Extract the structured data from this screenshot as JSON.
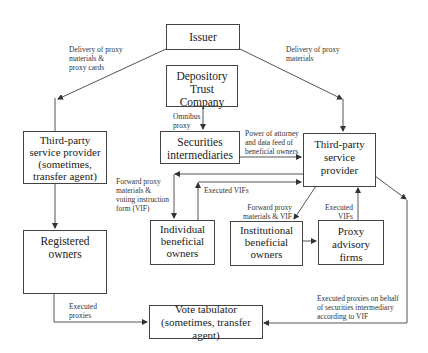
{
  "diagram": {
    "nodes": {
      "issuer": "Issuer",
      "dtc": "Depository\nTrust Company",
      "securities_intermediaries": "Securities\nintermediaries",
      "third_party_right": "Third-party\nservice provider",
      "third_party_left": "Third-party\nservice provider\n(sometimes,\ntransfer agent)",
      "registered_owners": "Registered\nowners",
      "individual_bo": "Individual\nbeneficial\nowners",
      "institutional_bo": "Institutional\nbeneficial\nowners",
      "proxy_advisory": "Proxy advisory\nfirms",
      "vote_tabulator": "Vote tabulator\n(sometimes, transfer agent)"
    },
    "edges": {
      "issuer_to_left": "Delivery of proxy\nmaterials &\nproxy cards",
      "issuer_to_right": "Delivery of proxy\nmaterials",
      "dtc_to_si": "Omnibus\nproxy",
      "si_to_right": "Power of attorney\nand data feed of\nbeneficial owners",
      "right_to_individual": "Forward proxy\nmaterials &\nvoting instruction\nform (VIF)",
      "individual_to_right": "Executed VIFs",
      "right_to_institutional": "Forward proxy\nmaterials & VIF",
      "advisory_to_right": "Executed\nVIFs",
      "registered_to_tabulator": "Executed\nproxies",
      "right_to_tabulator": "Executed proxies on behalf\nof securities intermediary\naccording to VIF"
    },
    "colors": {
      "line": "#444444",
      "text": "#222222",
      "background": "#ffffff"
    }
  }
}
